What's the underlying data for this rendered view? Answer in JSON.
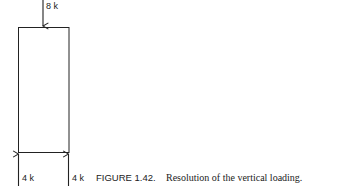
{
  "diagram": {
    "top_load": {
      "label": "8 k",
      "direction": "down"
    },
    "reactions": [
      {
        "label": "4 k",
        "direction": "up",
        "position": "left"
      },
      {
        "label": "4 k",
        "direction": "up",
        "position": "right"
      }
    ],
    "member": {
      "shape": "rectangle"
    }
  },
  "caption": {
    "figure_label": "FIGURE 1.42.",
    "text": "Resolution of the vertical loading."
  },
  "colors": {
    "line": "#222222",
    "background": "#ffffff"
  }
}
